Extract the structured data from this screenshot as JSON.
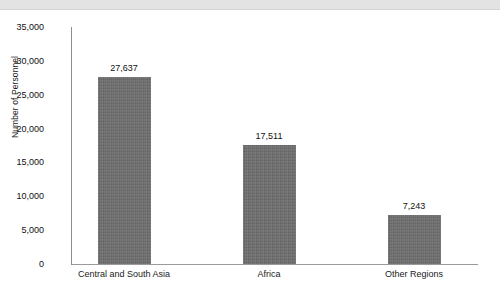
{
  "chart_data": {
    "type": "bar",
    "title": "",
    "subtitle": "",
    "xlabel": "",
    "ylabel": "Number of Personnel",
    "categories": [
      "Central and South Asia",
      "Africa",
      "Other Regions"
    ],
    "values": [
      27637,
      17511,
      7243
    ],
    "value_labels": [
      "27,637",
      "17,511",
      "7,243"
    ],
    "ylim": [
      0,
      35000
    ],
    "ytick_values": [
      0,
      5000,
      10000,
      15000,
      20000,
      25000,
      30000,
      35000
    ],
    "ytick_labels": [
      "0",
      "5,000",
      "10,000",
      "15,000",
      "20,000",
      "25,000",
      "30,000",
      "35,000"
    ],
    "grid": false,
    "legend": "none",
    "bar_color": "#6e6e6e",
    "axis_color": "#8d8d8d",
    "background_color": "#ffffff",
    "header_band_color": "#e3e3e3"
  }
}
